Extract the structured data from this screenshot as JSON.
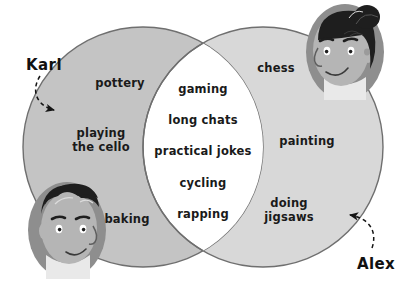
{
  "diagram": {
    "type": "venn-2-set",
    "title_visible": false,
    "background_color": "#ffffff",
    "left_circle": {
      "owner": "Karl",
      "fill_color": "#c4c4c4",
      "stroke_color": "#6f6f6f",
      "items": [
        {
          "label": "pottery",
          "x": 120,
          "y": 83
        },
        {
          "label": "playing\nthe cello",
          "x": 101,
          "y": 140
        },
        {
          "label": "baking",
          "x": 127,
          "y": 219
        }
      ]
    },
    "right_circle": {
      "owner": "Alex",
      "fill_color": "#d8d8d8",
      "stroke_color": "#6f6f6f",
      "items": [
        {
          "label": "chess",
          "x": 276,
          "y": 68
        },
        {
          "label": "painting",
          "x": 307,
          "y": 141
        },
        {
          "label": "doing\njigsaws",
          "x": 289,
          "y": 210
        }
      ]
    },
    "intersection": {
      "fill_color": "#ffffff",
      "items": [
        {
          "label": "gaming",
          "x": 203,
          "y": 89
        },
        {
          "label": "long chats",
          "x": 203,
          "y": 120
        },
        {
          "label": "practical jokes",
          "x": 203,
          "y": 151
        },
        {
          "label": "cycling",
          "x": 203,
          "y": 183
        },
        {
          "label": "rapping",
          "x": 203,
          "y": 214
        }
      ]
    },
    "annotations": [
      {
        "name": "Karl",
        "label_x": 44,
        "label_y": 65,
        "arrow_points_to": "left-circle-edge",
        "arrow_style": "dashed-curved"
      },
      {
        "name": "Alex",
        "label_x": 376,
        "label_y": 264,
        "arrow_points_to": "right-circle-edge",
        "arrow_style": "dashed-curved"
      }
    ],
    "portraits": [
      {
        "person": "Karl",
        "description": "boy-face-dark-spiky-hair",
        "position": "bottom-left",
        "x": 28,
        "y": 182,
        "width": 78,
        "height": 96,
        "hair_color": "#1e1e1e",
        "skin_color": "#b5b5b5",
        "frame_color": "#8e8e8e"
      },
      {
        "person": "Alex",
        "description": "girl-face-top-bun-hair",
        "position": "top-right",
        "x": 306,
        "y": 2,
        "width": 80,
        "height": 98,
        "hair_color": "#1e1e1e",
        "skin_color": "#b5b5b5",
        "frame_color": "#8e8e8e"
      }
    ]
  }
}
